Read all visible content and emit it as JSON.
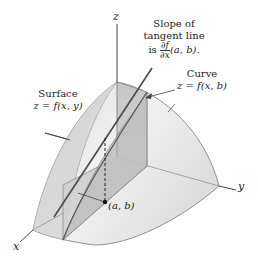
{
  "figure": {
    "type": "3d-surface-diagram",
    "axes": {
      "z_label": "z",
      "y_label": "y",
      "x_label": "x"
    },
    "annotations": {
      "slope": {
        "line1": "Slope of",
        "line2": "tangent line",
        "line3_prefix": "is",
        "frac_num": "∂f",
        "frac_den": "∂x",
        "line3_suffix": "(a, b)."
      },
      "curve": {
        "line1": "Curve",
        "line2": "z = f(x, b)"
      },
      "surface": {
        "line1": "Surface",
        "line2": "z = f(x, y)"
      },
      "point": "(a, b)"
    },
    "colors": {
      "surface_fill": "#e6e6e6",
      "surface_shade": "#cfcfcf",
      "plane_fill": "#c8c8c8",
      "line": "#555555",
      "tangent": "#444444"
    }
  }
}
